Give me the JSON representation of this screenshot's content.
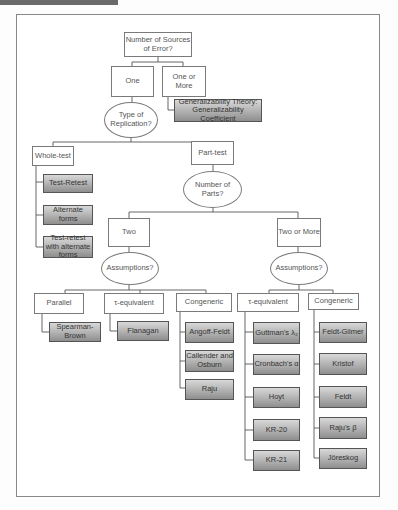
{
  "root": {
    "label": "Number of Sources of Error?"
  },
  "level1": {
    "one": "One",
    "one_or_more": "One or More",
    "generalizability": "Generalizability Theory: Generalizability Coefficient"
  },
  "replication": {
    "question": "Type of Replication?",
    "whole_test": "Whole-test",
    "part_test": "Part-test",
    "whole_test_methods": [
      "Test-Retest",
      "Alternate forms",
      "Test-retest with alternate forms"
    ]
  },
  "parts": {
    "question": "Number of Parts?",
    "two": "Two",
    "two_or_more": "Two or More"
  },
  "two_branch": {
    "question": "Assumptions?",
    "categories": [
      "Parallel",
      "τ-equivalent",
      "Congeneric"
    ],
    "parallel_methods": [
      "Spearman-Brown"
    ],
    "tau_methods": [
      "Flanagan"
    ],
    "congeneric_methods": [
      "Angoff-Feldt",
      "Callender and Osburn",
      "Raju"
    ]
  },
  "more_branch": {
    "question": "Assumptions?",
    "categories": [
      "τ-equivalent",
      "Congeneric"
    ],
    "tau_methods": [
      "Guttman's λ₂",
      "Cronbach's α",
      "Hoyt",
      "KR-20",
      "KR-21"
    ],
    "congeneric_methods": [
      "Feldt-Gilmer",
      "Kristof",
      "Feldt",
      "Raju's β",
      "Jöreskog"
    ]
  }
}
